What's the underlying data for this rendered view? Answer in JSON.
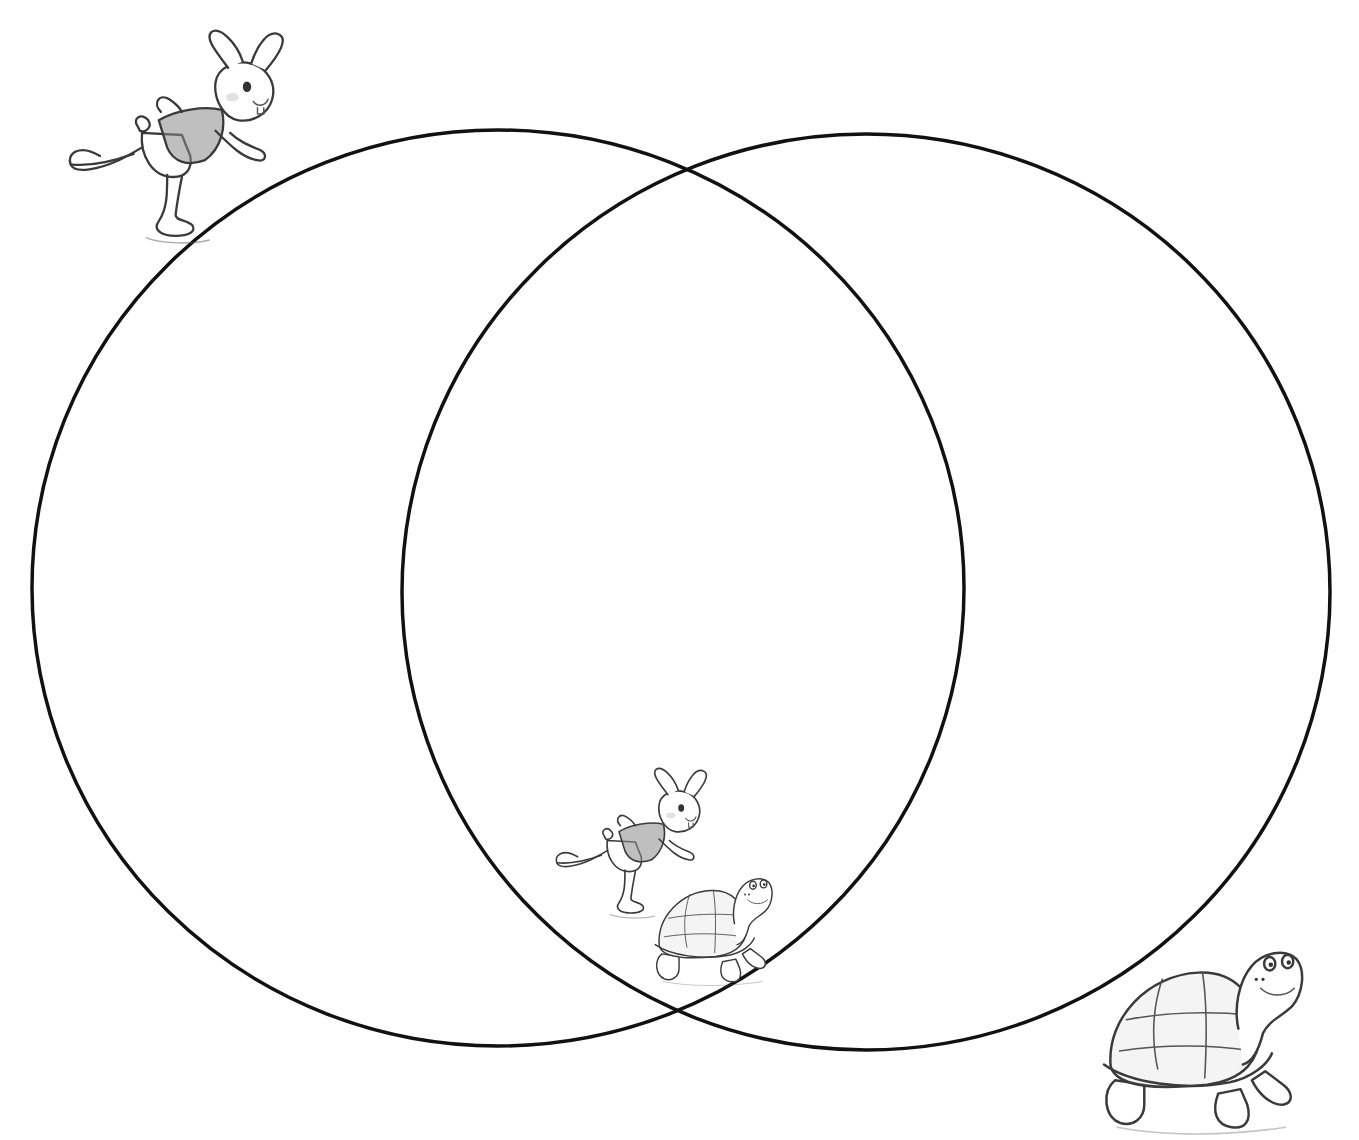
{
  "diagram": {
    "type": "venn",
    "sets": [
      {
        "id": "left",
        "label": "",
        "icon": "hare-icon",
        "center": [
          498,
          588
        ],
        "rx": 466,
        "ry": 458
      },
      {
        "id": "right",
        "label": "",
        "icon": "tortoise-icon",
        "center": [
          866,
          592
        ],
        "rx": 464,
        "ry": 458
      }
    ],
    "intersection": {
      "label": "",
      "icons": [
        "hare-icon",
        "tortoise-icon"
      ]
    },
    "stroke_color": "#111111",
    "stroke_width": 3.5,
    "background": "#ffffff"
  },
  "illustrations": {
    "left_corner": "hare-icon",
    "right_corner": "tortoise-icon",
    "center_pair": [
      "hare-icon",
      "tortoise-icon"
    ]
  }
}
